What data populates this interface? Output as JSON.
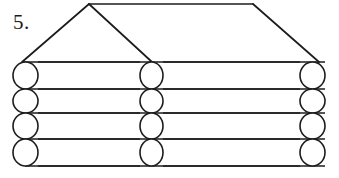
{
  "figure": {
    "label": "5.",
    "stroke_color": "#1c1c1c",
    "fill_color": "#ffffff",
    "background_color": "#ffffff",
    "width": 339,
    "height": 178
  },
  "roof": {
    "name": "roof-outline",
    "apex_left": {
      "x": 89,
      "y": 4
    },
    "apex_right": {
      "x": 253,
      "y": 4
    },
    "base_left": {
      "x": 22,
      "y": 62
    },
    "base_right": {
      "x": 319,
      "y": 62
    },
    "inner_diagonal_end": {
      "x": 152,
      "y": 62
    },
    "segments": [
      {
        "name": "ridge-top",
        "x1": 89,
        "y1": 4,
        "x2": 253,
        "y2": 4
      },
      {
        "name": "roof-left-slope",
        "x1": 89,
        "y1": 4,
        "x2": 22,
        "y2": 62
      },
      {
        "name": "roof-right-slope",
        "x1": 253,
        "y1": 4,
        "x2": 319,
        "y2": 62
      },
      {
        "name": "roof-inner-diagonal",
        "x1": 89,
        "y1": 4,
        "x2": 152,
        "y2": 62
      }
    ]
  },
  "logs": {
    "count": 4,
    "row_tops": [
      62,
      89,
      113,
      139
    ],
    "row_bottoms": [
      89,
      113,
      139,
      166
    ],
    "line_y_positions": [
      62,
      89,
      113,
      139,
      166
    ],
    "line_x_start": 25,
    "line_x_end": 325,
    "end_circles": {
      "columns": [
        {
          "name": "left-log-ends",
          "cx": 25.5,
          "rx": 12.5
        },
        {
          "name": "middle-log-ends",
          "cx": 151.5,
          "rx": 11.5
        },
        {
          "name": "right-log-ends",
          "cx": 312.5,
          "rx": 12.5
        }
      ],
      "rows": [
        {
          "cy": 75.5,
          "ry": 13.5
        },
        {
          "cy": 101,
          "ry": 12
        },
        {
          "cy": 126,
          "ry": 13
        },
        {
          "cy": 152.5,
          "ry": 13.5
        }
      ]
    }
  }
}
